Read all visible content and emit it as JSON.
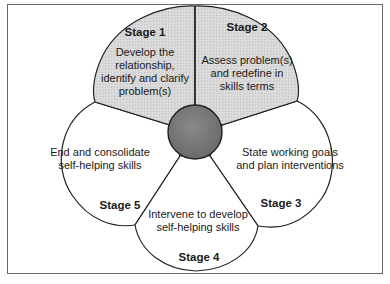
{
  "diagram": {
    "type": "five-petal-cycle",
    "colors": {
      "shaded_petal": "#d6d6d6",
      "plain_petal": "#ffffff",
      "center": "#7a7a7a",
      "outline": "#222222",
      "frame": "#6a6a6a"
    },
    "stages": [
      {
        "id": 1,
        "title": "Stage 1",
        "lines": [
          "Develop the",
          "relationship,",
          "identify and clarify",
          "problem(s)"
        ],
        "shaded": true
      },
      {
        "id": 2,
        "title": "Stage 2",
        "lines": [
          "Assess problem(s)",
          "and redefine in",
          "skills terms"
        ],
        "shaded": true
      },
      {
        "id": 3,
        "title": "Stage 3",
        "lines": [
          "State working goals",
          "and plan interventions"
        ],
        "shaded": false
      },
      {
        "id": 4,
        "title": "Stage 4",
        "lines": [
          "Intervene to develop",
          "self-helping skills"
        ],
        "shaded": false
      },
      {
        "id": 5,
        "title": "Stage 5",
        "lines": [
          "End and consolidate",
          "self-helping skills"
        ],
        "shaded": false
      }
    ]
  }
}
